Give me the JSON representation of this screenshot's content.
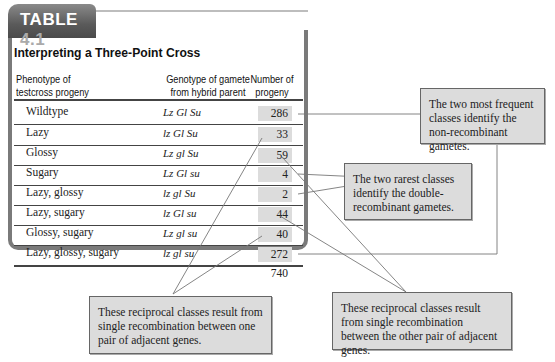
{
  "table": {
    "tab_label": "TABLE",
    "tab_number": "4.1",
    "title": "Interpreting a Three-Point Cross",
    "headers": {
      "phenotype": [
        "Phenotype of",
        "testcross progeny"
      ],
      "genotype": [
        "Genotype of gamete",
        "from hybrid parent"
      ],
      "number": [
        "Number of",
        "progeny"
      ]
    },
    "rows": [
      {
        "phenotype": "Wildtype",
        "genotype": "Lz Gl Su",
        "count": "286"
      },
      {
        "phenotype": "Lazy",
        "genotype": "lz Gl Su",
        "count": "33"
      },
      {
        "phenotype": "Glossy",
        "genotype": "Lz gl Su",
        "count": "59"
      },
      {
        "phenotype": "Sugary",
        "genotype": "Lz Gl su",
        "count": "4"
      },
      {
        "phenotype": "Lazy, glossy",
        "genotype": "lz gl Su",
        "count": "2"
      },
      {
        "phenotype": "Lazy, sugary",
        "genotype": "lz Gl su",
        "count": "44"
      },
      {
        "phenotype": "Glossy, sugary",
        "genotype": "Lz gl su",
        "count": "40"
      },
      {
        "phenotype": "Lazy, glossy, sugary",
        "genotype": "lz gl su",
        "count": "272"
      }
    ],
    "total": "740"
  },
  "callouts": {
    "nonrecombinant": "The two most frequent classes identify the non-recombinant gametes.",
    "double": "The two rarest classes identify the double-recombinant gametes.",
    "single_one": "These reciprocal classes result from single recombination between one pair of adjacent genes.",
    "single_other": "These reciprocal classes result from single recombination between the other pair of adjacent genes."
  },
  "colors": {
    "tab_gray": "#5a5a5a",
    "frame_gray": "#7a7a7a",
    "box_fill": "#dcdcdc",
    "callout_border": "#666666"
  }
}
